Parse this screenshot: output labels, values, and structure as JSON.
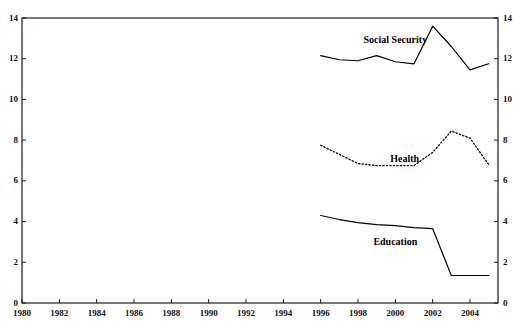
{
  "chart_data": {
    "type": "line",
    "title": "",
    "subtitle": "",
    "xlabel": "",
    "ylabel": "",
    "xlim": [
      1980,
      2005.5
    ],
    "ylim": [
      0,
      14
    ],
    "grid": false,
    "legend_position": "inline-annotations",
    "dual_y_axis": true,
    "x_ticks": [
      "1980",
      "1982",
      "1984",
      "1986",
      "1988",
      "1990",
      "1992",
      "1994",
      "1996",
      "1998",
      "2000",
      "2002",
      "2004"
    ],
    "x_tick_values": [
      1980,
      1982,
      1984,
      1986,
      1988,
      1990,
      1992,
      1994,
      1996,
      1998,
      2000,
      2002,
      2004
    ],
    "y_ticks_left": [
      "0",
      "2",
      "4",
      "6",
      "8",
      "10",
      "12",
      "14"
    ],
    "y_ticks_right": [
      "0",
      "2",
      "4",
      "6",
      "8",
      "10",
      "12",
      "14"
    ],
    "y_tick_values": [
      0,
      2,
      4,
      6,
      8,
      10,
      12,
      14
    ],
    "x": [
      1996,
      1997,
      1998,
      1999,
      2000,
      2001,
      2002,
      2003,
      2004,
      2005
    ],
    "series": [
      {
        "name": "Social Security",
        "style": "solid",
        "color": "#000000",
        "label_x": 2000.0,
        "label_y": 12.9,
        "values": [
          12.15,
          11.95,
          11.9,
          12.15,
          11.85,
          11.75,
          13.6,
          12.6,
          11.45,
          11.75
        ]
      },
      {
        "name": "Health",
        "style": "dotted",
        "color": "#000000",
        "label_x": 2000.5,
        "label_y": 7.05,
        "values": [
          7.75,
          7.3,
          6.85,
          6.75,
          6.75,
          6.75,
          7.4,
          8.45,
          8.1,
          6.8
        ]
      },
      {
        "name": "Education",
        "style": "solid",
        "color": "#000000",
        "label_x": 2000.0,
        "label_y": 3.0,
        "values": [
          4.3,
          4.1,
          3.95,
          3.85,
          3.8,
          3.7,
          3.65,
          1.35,
          1.35,
          1.35
        ]
      }
    ]
  },
  "axes": {
    "frame_color": "#1a1a1a",
    "background": "#ffffff"
  }
}
